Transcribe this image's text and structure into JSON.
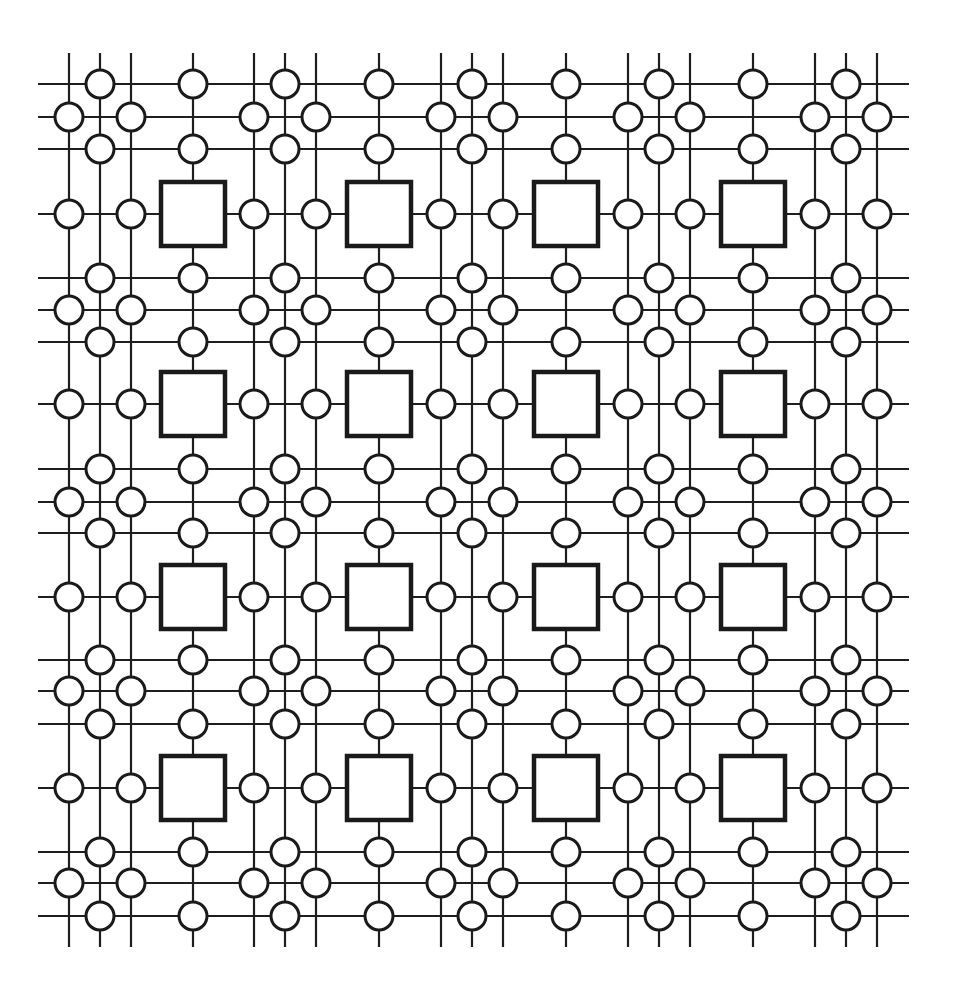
{
  "diagram": {
    "title": "",
    "colors": {
      "line": "#1e1e1e",
      "node_stroke": "#1a1a1a",
      "node_fill": "#ffffff",
      "block_stroke": "#1a1a1a",
      "block_fill": "#ffffff",
      "background": "#ffffff"
    },
    "extent": {
      "h_line_x_start": 38,
      "h_line_x_end": 909,
      "v_line_y_start": 53,
      "v_line_y_end": 947
    },
    "columns": {
      "wire_groups": [
        [
          69,
          100,
          131
        ],
        [
          254,
          285,
          316
        ],
        [
          441,
          472,
          503
        ],
        [
          628,
          659,
          690
        ],
        [
          815,
          846,
          877
        ]
      ],
      "block_columns": [
        193,
        379,
        566,
        753
      ]
    },
    "rows": {
      "wire_groups": [
        [
          84,
          117,
          149
        ],
        [
          278,
          310,
          342
        ],
        [
          469,
          502,
          533
        ],
        [
          660,
          691,
          724
        ],
        [
          852,
          883,
          916
        ]
      ],
      "block_rows": [
        214,
        404,
        597,
        788
      ]
    },
    "node": {
      "radius": 14
    },
    "block": {
      "size": 64
    },
    "block_grid": {
      "rows": 4,
      "cols": 4
    }
  }
}
